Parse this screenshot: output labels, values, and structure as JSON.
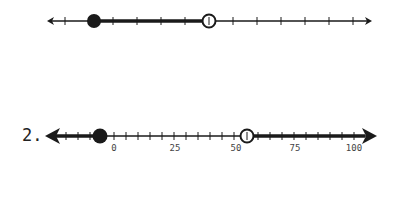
{
  "number_lines": [
    {
      "id": "line-1",
      "label": "",
      "y": 21,
      "x_start": 47,
      "x_end": 372,
      "arrow_style": "small",
      "ticks_x": [
        65,
        89,
        113,
        137,
        161,
        185,
        209,
        233,
        257,
        281,
        305,
        329,
        353
      ],
      "tick_labels": [],
      "closed_point": {
        "x": 94,
        "label": "filled-dot"
      },
      "open_point": {
        "x": 209,
        "label": "open-circle"
      },
      "shaded_segment": {
        "from_x": 94,
        "to_x": 209,
        "description": "between closed and open point"
      }
    },
    {
      "id": "line-2",
      "label": "2.",
      "y": 136,
      "x_start": 45,
      "x_end": 377,
      "arrow_style": "large",
      "unit_scale": {
        "value_0_x": 114,
        "value_100_x": 354
      },
      "tick_step": 5,
      "tick_range": [
        -25,
        100
      ],
      "tick_labels": [
        {
          "value": "0",
          "x": 114
        },
        {
          "value": "25",
          "x": 175
        },
        {
          "value": "50",
          "x": 236
        },
        {
          "value": "75",
          "x": 295
        },
        {
          "value": "100",
          "x": 354
        }
      ],
      "closed_point": {
        "value": -5,
        "x": 100,
        "label": "filled-dot"
      },
      "open_point": {
        "value": 55,
        "x": 247,
        "label": "open-circle"
      },
      "shaded_rays": [
        {
          "direction": "left",
          "from_x": 100,
          "description": "x <= -5"
        },
        {
          "direction": "right",
          "from_x": 247,
          "description": "x > 55"
        }
      ]
    }
  ],
  "colors": {
    "line": "#1a1a1a",
    "background": "#ffffff"
  }
}
